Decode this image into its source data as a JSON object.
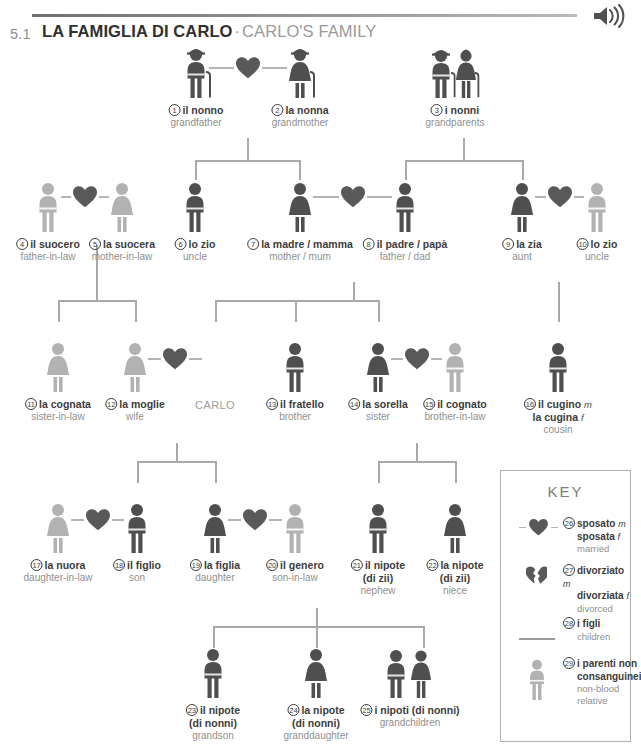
{
  "header": {
    "section_number": "5.1",
    "title_it": "LA FAMIGLIA DI CARLO",
    "separator": "·",
    "title_en": "CARLO'S FAMILY",
    "audio_icon": "speaker-icon"
  },
  "colors": {
    "blood_relative": "#4f4f4f",
    "non_blood_relative": "#b2b2b2",
    "heart": "#595959",
    "connector": "#a9a9a9",
    "label_it": "#3c3c3c",
    "label_en": "#8f8f8f"
  },
  "carlo_label": "CARLO",
  "people": [
    {
      "n": "1",
      "it": "il nonno",
      "gen": "",
      "it2": "",
      "gen2": "",
      "en": "grandfather",
      "x": 196,
      "y": 48,
      "sex": "m",
      "blood": true,
      "cane": true,
      "hat": true,
      "pair": false
    },
    {
      "n": "2",
      "it": "la nonna",
      "gen": "",
      "it2": "",
      "gen2": "",
      "en": "grandmother",
      "x": 300,
      "y": 48,
      "sex": "f",
      "blood": true,
      "cane": true,
      "hat": true,
      "pair": false
    },
    {
      "n": "3",
      "it": "i nonni",
      "gen": "",
      "it2": "",
      "gen2": "",
      "en": "grandparents",
      "x": 455,
      "y": 48,
      "sex": "p",
      "blood": true,
      "cane": true,
      "hat": true,
      "pair": true
    },
    {
      "n": "4",
      "it": "il suocero",
      "gen": "",
      "it2": "",
      "gen2": "",
      "en": "father-in-law",
      "x": 48,
      "y": 182,
      "sex": "m",
      "blood": false,
      "cane": false,
      "hat": false,
      "pair": false
    },
    {
      "n": "5",
      "it": "la suocera",
      "gen": "",
      "it2": "",
      "gen2": "",
      "en": "mother-in-law",
      "x": 122,
      "y": 182,
      "sex": "f",
      "blood": false,
      "cane": false,
      "hat": false,
      "pair": false
    },
    {
      "n": "6",
      "it": "lo zio",
      "gen": "",
      "it2": "",
      "gen2": "",
      "en": "uncle",
      "x": 195,
      "y": 182,
      "sex": "m",
      "blood": true,
      "cane": false,
      "hat": false,
      "pair": false
    },
    {
      "n": "7",
      "it": "la madre / mamma",
      "gen": "",
      "it2": "",
      "gen2": "",
      "en": "mother / mum",
      "x": 300,
      "y": 182,
      "sex": "f",
      "blood": true,
      "cane": false,
      "hat": false,
      "pair": false
    },
    {
      "n": "8",
      "it": "il padre / papà",
      "gen": "",
      "it2": "",
      "gen2": "",
      "en": "father / dad",
      "x": 405,
      "y": 182,
      "sex": "m",
      "blood": true,
      "cane": false,
      "hat": false,
      "pair": false
    },
    {
      "n": "9",
      "it": "la zia",
      "gen": "",
      "it2": "",
      "gen2": "",
      "en": "aunt",
      "x": 522,
      "y": 182,
      "sex": "f",
      "blood": true,
      "cane": false,
      "hat": false,
      "pair": false
    },
    {
      "n": "10",
      "it": "lo zio",
      "gen": "",
      "it2": "",
      "gen2": "",
      "en": "uncle",
      "x": 597,
      "y": 182,
      "sex": "m",
      "blood": false,
      "cane": false,
      "hat": false,
      "pair": false
    },
    {
      "n": "11",
      "it": "la cognata",
      "gen": "",
      "it2": "",
      "gen2": "",
      "en": "sister-in-law",
      "x": 58,
      "y": 342,
      "sex": "f",
      "blood": false,
      "cane": false,
      "hat": false,
      "pair": false
    },
    {
      "n": "12",
      "it": "la moglie",
      "gen": "",
      "it2": "",
      "gen2": "",
      "en": "wife",
      "x": 135,
      "y": 342,
      "sex": "f",
      "blood": false,
      "cane": false,
      "hat": false,
      "pair": false
    },
    {
      "n": "13",
      "it": "il fratello",
      "gen": "",
      "it2": "",
      "gen2": "",
      "en": "brother",
      "x": 295,
      "y": 342,
      "sex": "m",
      "blood": true,
      "cane": false,
      "hat": false,
      "pair": false
    },
    {
      "n": "14",
      "it": "la sorella",
      "gen": "",
      "it2": "",
      "gen2": "",
      "en": "sister",
      "x": 378,
      "y": 342,
      "sex": "f",
      "blood": true,
      "cane": false,
      "hat": false,
      "pair": false
    },
    {
      "n": "15",
      "it": "il cognato",
      "gen": "",
      "it2": "",
      "gen2": "",
      "en": "brother-in-law",
      "x": 455,
      "y": 342,
      "sex": "m",
      "blood": false,
      "cane": false,
      "hat": false,
      "pair": false
    },
    {
      "n": "16",
      "it": "il cugino",
      "gen": "m",
      "it2": "la cugina",
      "gen2": "f",
      "en": "cousin",
      "x": 558,
      "y": 342,
      "sex": "m",
      "blood": true,
      "cane": false,
      "hat": false,
      "pair": false
    },
    {
      "n": "17",
      "it": "la nuora",
      "gen": "",
      "it2": "",
      "gen2": "",
      "en": "daughter-in-law",
      "x": 58,
      "y": 503,
      "sex": "f",
      "blood": false,
      "cane": false,
      "hat": false,
      "pair": false
    },
    {
      "n": "18",
      "it": "il figlio",
      "gen": "",
      "it2": "",
      "gen2": "",
      "en": "son",
      "x": 137,
      "y": 503,
      "sex": "m",
      "blood": true,
      "cane": false,
      "hat": false,
      "pair": false
    },
    {
      "n": "19",
      "it": "la figlia",
      "gen": "",
      "it2": "",
      "gen2": "",
      "en": "daughter",
      "x": 215,
      "y": 503,
      "sex": "f",
      "blood": true,
      "cane": false,
      "hat": false,
      "pair": false
    },
    {
      "n": "20",
      "it": "il genero",
      "gen": "",
      "it2": "",
      "gen2": "",
      "en": "son-in-law",
      "x": 295,
      "y": 503,
      "sex": "m",
      "blood": false,
      "cane": false,
      "hat": false,
      "pair": false
    },
    {
      "n": "21",
      "it": "il nipote",
      "gen": "",
      "it2": "(di zii)",
      "gen2": "",
      "en": "nephew",
      "x": 378,
      "y": 503,
      "sex": "m",
      "blood": true,
      "cane": false,
      "hat": false,
      "pair": false
    },
    {
      "n": "22",
      "it": "la nipote",
      "gen": "",
      "it2": "(di zii)",
      "gen2": "",
      "en": "niece",
      "x": 455,
      "y": 503,
      "sex": "f",
      "blood": true,
      "cane": false,
      "hat": false,
      "pair": false
    },
    {
      "n": "23",
      "it": "il nipote",
      "gen": "",
      "it2": "(di nonni)",
      "gen2": "",
      "en": "grandson",
      "x": 213,
      "y": 648,
      "sex": "m",
      "blood": true,
      "cane": false,
      "hat": false,
      "pair": false
    },
    {
      "n": "24",
      "it": "la nipote",
      "gen": "",
      "it2": "(di nonni)",
      "gen2": "",
      "en": "granddaughter",
      "x": 316,
      "y": 648,
      "sex": "f",
      "blood": true,
      "cane": false,
      "hat": false,
      "pair": false
    },
    {
      "n": "25",
      "it": "i nipoti (di nonni)",
      "gen": "",
      "it2": "",
      "gen2": "",
      "en": "grandchildren",
      "x": 410,
      "y": 648,
      "sex": "p",
      "blood": true,
      "cane": false,
      "hat": false,
      "pair": true
    }
  ],
  "key": {
    "title": "KEY",
    "items": [
      {
        "n": "26",
        "it": "sposato",
        "gen": "m",
        "it2": "sposata",
        "gen2": "f",
        "en": "married",
        "art": "heart-icon"
      },
      {
        "n": "27",
        "it": "divorziato",
        "gen": "m",
        "it2": "divorziata",
        "gen2": "f",
        "en": "divorced",
        "art": "broken-heart-icon"
      },
      {
        "n": "28",
        "it": "i figli",
        "gen": "",
        "it2": "",
        "gen2": "",
        "en": "children",
        "art": "line-icon"
      },
      {
        "n": "29",
        "it": "i parenti non",
        "gen": "",
        "it2": "consanguinei",
        "gen2": "",
        "en": "non-blood relative",
        "art": "gray-person-icon"
      }
    ]
  }
}
